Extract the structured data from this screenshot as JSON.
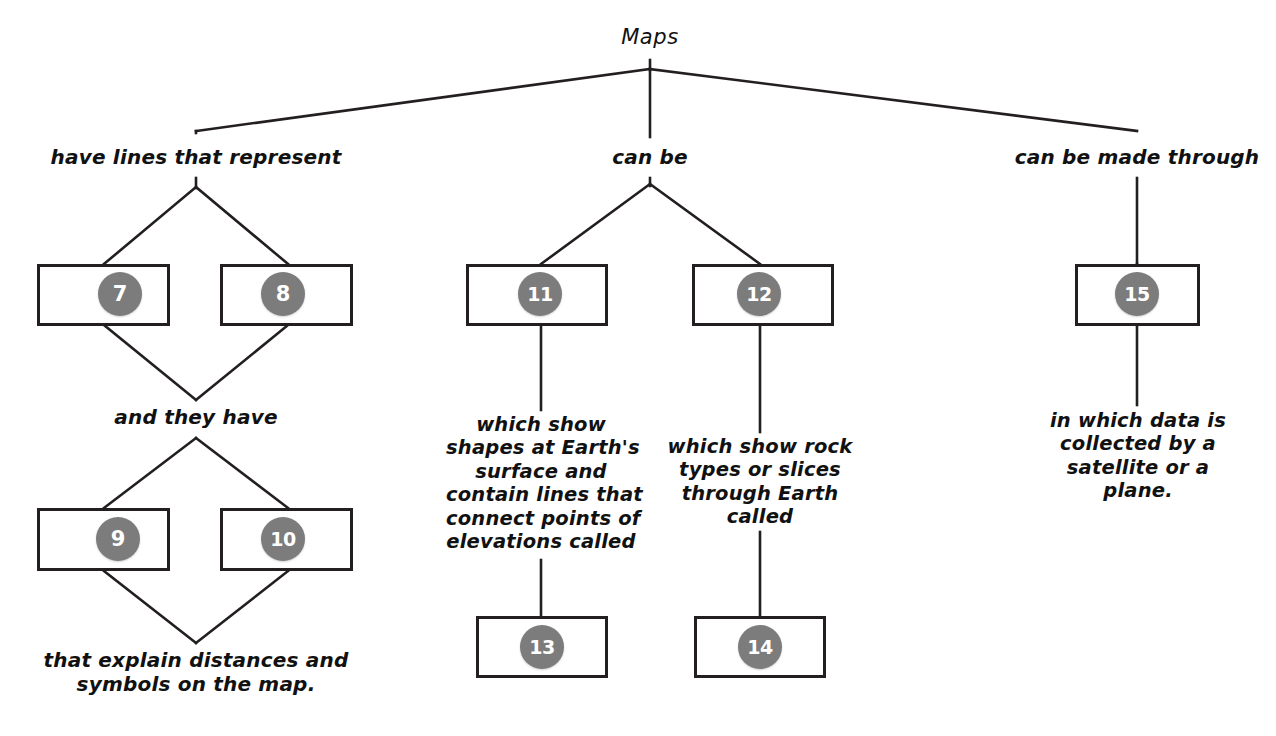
{
  "document": {
    "type": "concept-map",
    "title": "Maps",
    "root_label": "Maps"
  },
  "style": {
    "badge_fill": "#7c7c7c",
    "badge_text": "#ffffff",
    "box_border": "#231f20",
    "line_color": "#231f20",
    "background": "#ffffff"
  },
  "branches": {
    "left_label": "have lines that represent",
    "middle_label": "can be",
    "right_label": "can be made through",
    "left_sub_label": "and they have"
  },
  "descriptions": {
    "left_bottom_caption": "that explain distances and\nsymbols on the map.",
    "middle_left_text": "which show\nshapes at Earth's\nsurface and\ncontain lines that\nconnect points of\nelevations called",
    "middle_right_text": "which show rock\ntypes or slices\nthrough Earth\ncalled",
    "right_text": "in which data is\ncollected by a\nsatellite or a\nplane."
  },
  "boxes": [
    {
      "id": "box-7",
      "number": "7"
    },
    {
      "id": "box-8",
      "number": "8"
    },
    {
      "id": "box-9",
      "number": "9"
    },
    {
      "id": "box-10",
      "number": "10"
    },
    {
      "id": "box-11",
      "number": "11"
    },
    {
      "id": "box-12",
      "number": "12"
    },
    {
      "id": "box-13",
      "number": "13"
    },
    {
      "id": "box-14",
      "number": "14"
    },
    {
      "id": "box-15",
      "number": "15"
    }
  ]
}
